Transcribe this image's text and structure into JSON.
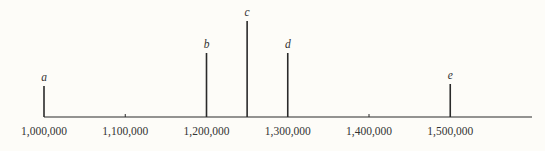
{
  "chart_data": {
    "type": "bar",
    "subtype": "spike/stem",
    "title": "",
    "xlabel": "",
    "ylabel": "",
    "x_axis": {
      "min": 1000000,
      "max": 1590000,
      "ticks": [
        1000000,
        1100000,
        1200000,
        1300000,
        1400000,
        1500000
      ],
      "tick_labels": [
        "1,000,000",
        "1,100,000",
        "1,200,000",
        "1,300,000",
        "1,400,000",
        "1,500,000"
      ]
    },
    "y_axis": {
      "visible": false,
      "units": "relative height"
    },
    "grid": false,
    "legend": null,
    "series": [
      {
        "name": "spikes",
        "points": [
          {
            "label": "a",
            "x": 1000000,
            "height": 31
          },
          {
            "label": "b",
            "x": 1200000,
            "height": 64
          },
          {
            "label": "c",
            "x": 1250000,
            "height": 96
          },
          {
            "label": "d",
            "x": 1300000,
            "height": 64
          },
          {
            "label": "e",
            "x": 1500000,
            "height": 33
          }
        ]
      }
    ]
  },
  "layout": {
    "x0_px": 44,
    "px_per_unit": 0.0008125,
    "baseline_px": 117,
    "axis_end_px": 532,
    "minor_ticks_at": [
      1100000,
      1400000
    ],
    "colors": {
      "line": "#2a2a2a",
      "text": "#333333",
      "background": "#fdfcf8"
    }
  }
}
